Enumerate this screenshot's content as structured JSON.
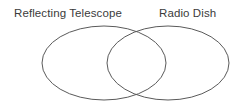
{
  "diagram": {
    "type": "venn",
    "title": "",
    "background_color": "#ffffff",
    "stroke_color": "#5a5a5a",
    "text_color": "#3b3b3b",
    "labels": {
      "left": "Reflecting Telescope",
      "right": "Radio Dish"
    },
    "sets": [
      {
        "name": "Reflecting Telescope",
        "shape": "ellipse",
        "cx": 104,
        "cy": 63,
        "rx": 62,
        "ry": 37
      },
      {
        "name": "Radio Dish",
        "shape": "ellipse",
        "cx": 168,
        "cy": 63,
        "rx": 61,
        "ry": 37
      }
    ],
    "regions": {
      "left_only_text": "",
      "overlap_text": "",
      "right_only_text": ""
    }
  }
}
